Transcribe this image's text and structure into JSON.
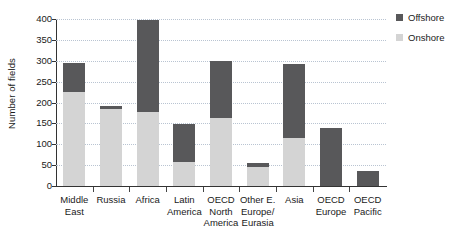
{
  "chart_data": {
    "type": "bar",
    "subtype": "stacked-vertical",
    "title": "",
    "xlabel": "",
    "ylabel": "Number of fields",
    "ylim": [
      0,
      400
    ],
    "ytick_step": 50,
    "yticks": [
      0,
      50,
      100,
      150,
      200,
      250,
      300,
      350,
      400
    ],
    "ytick_labels": [
      "0",
      "50",
      "100",
      "150",
      "200",
      "250",
      "300",
      "350",
      "400"
    ],
    "grid": true,
    "grid_axis": "y",
    "grid_style": "dotted",
    "legend_position": "right-top",
    "categories": [
      "Middle\nEast",
      "Russia",
      "Africa",
      "Latin\nAmerica",
      "OECD\nNorth\nAmerica",
      "Other E.\nEurope/\nEurasia",
      "Asia",
      "OECD\nEurope",
      "OECD\nPacific"
    ],
    "categories_flat": [
      "Middle East",
      "Russia",
      "Africa",
      "Latin America",
      "OECD North America",
      "Other E. Europe/Eurasia",
      "Asia",
      "OECD Europe",
      "OECD Pacific"
    ],
    "series": [
      {
        "name": "Onshore",
        "color": "#d4d4d4",
        "values": [
          225,
          185,
          178,
          58,
          162,
          45,
          115,
          0,
          0
        ]
      },
      {
        "name": "Offshore",
        "color": "#58585a",
        "values": [
          70,
          7,
          219,
          90,
          138,
          10,
          178,
          140,
          35
        ]
      }
    ],
    "totals": [
      295,
      192,
      397,
      148,
      300,
      55,
      293,
      140,
      35
    ]
  },
  "legend": {
    "items": [
      {
        "label": "Offshore",
        "color": "#58585a"
      },
      {
        "label": "Onshore",
        "color": "#d4d4d4"
      }
    ]
  },
  "colors": {
    "offshore": "#58585a",
    "onshore": "#d4d4d4",
    "axis": "#333333",
    "gridline": "#b9c4d2",
    "text": "#1a1a1a",
    "background": "#ffffff"
  }
}
